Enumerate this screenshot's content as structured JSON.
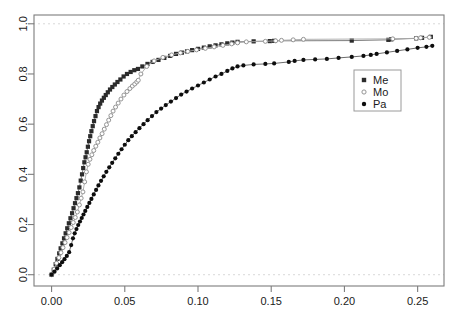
{
  "figure": {
    "background_color": "#ffffff",
    "width": 456,
    "height": 322
  },
  "chart_data": {
    "type": "line",
    "title": "",
    "subtitle": "",
    "xlabel": "",
    "ylabel": "",
    "xlim": [
      -0.012,
      0.268
    ],
    "ylim": [
      -0.045,
      1.035
    ],
    "grid": false,
    "reference_lines": [
      {
        "axis": "y",
        "value": 1.0,
        "style": "dashed",
        "color": "#d8d8d8"
      },
      {
        "axis": "y",
        "value": 0.0,
        "style": "dashed",
        "color": "#d8d8d8"
      }
    ],
    "xticks": [
      0.0,
      0.05,
      0.1,
      0.15,
      0.2,
      0.25
    ],
    "xticklabels": [
      "0.00",
      "0.05",
      "0.10",
      "0.15",
      "0.20",
      "0.25"
    ],
    "yticks": [
      0.0,
      0.2,
      0.4,
      0.6,
      0.8,
      1.0
    ],
    "yticklabels": [
      "0.0",
      "0.2",
      "0.4",
      "0.6",
      "0.8",
      "1.0"
    ],
    "legend": {
      "position": "right",
      "entries": [
        {
          "name": "Me",
          "marker": "filled-square",
          "color": "#2b2b2b"
        },
        {
          "name": "Mo",
          "marker": "open-circle",
          "color": "#8e8e8e"
        },
        {
          "name": "Pa",
          "marker": "filled-circle",
          "color": "#0d0d0d"
        }
      ]
    },
    "series": [
      {
        "name": "Me",
        "marker": "filled-square",
        "color": "#2b2b2b",
        "line_color": "#6f6f6f",
        "x": [
          0.0,
          0.0015,
          0.0028,
          0.004,
          0.0052,
          0.0062,
          0.0074,
          0.0085,
          0.0096,
          0.0107,
          0.0118,
          0.0129,
          0.014,
          0.015,
          0.016,
          0.017,
          0.018,
          0.019,
          0.0199,
          0.0208,
          0.0216,
          0.0224,
          0.0232,
          0.024,
          0.0248,
          0.0256,
          0.0264,
          0.0272,
          0.0281,
          0.029,
          0.03,
          0.031,
          0.0321,
          0.0332,
          0.0344,
          0.0357,
          0.037,
          0.0384,
          0.0399,
          0.0415,
          0.0432,
          0.045,
          0.047,
          0.0492,
          0.0515,
          0.054,
          0.0565,
          0.059,
          0.062,
          0.0655,
          0.069,
          0.073,
          0.077,
          0.081,
          0.085,
          0.089,
          0.0925,
          0.096,
          0.1,
          0.104,
          0.108,
          0.112,
          0.116,
          0.12,
          0.1235,
          0.127,
          0.138,
          0.149,
          0.152,
          0.205,
          0.23,
          0.232,
          0.249,
          0.253,
          0.259
        ],
        "y": [
          0.0,
          0.02,
          0.042,
          0.063,
          0.085,
          0.105,
          0.125,
          0.145,
          0.165,
          0.185,
          0.205,
          0.225,
          0.245,
          0.265,
          0.285,
          0.305,
          0.325,
          0.348,
          0.375,
          0.4,
          0.425,
          0.448,
          0.468,
          0.488,
          0.51,
          0.532,
          0.552,
          0.572,
          0.592,
          0.612,
          0.632,
          0.652,
          0.668,
          0.682,
          0.694,
          0.705,
          0.716,
          0.727,
          0.738,
          0.748,
          0.758,
          0.768,
          0.778,
          0.79,
          0.8,
          0.808,
          0.815,
          0.82,
          0.83,
          0.84,
          0.848,
          0.856,
          0.864,
          0.872,
          0.88,
          0.885,
          0.89,
          0.895,
          0.9,
          0.905,
          0.91,
          0.914,
          0.918,
          0.922,
          0.925,
          0.928,
          0.93,
          0.931,
          0.932,
          0.933,
          0.936,
          0.938,
          0.942,
          0.944,
          0.948
        ]
      },
      {
        "name": "Mo",
        "marker": "open-circle",
        "color": "#8e8e8e",
        "line_color": "#a8a8a8",
        "x": [
          0.0,
          0.0018,
          0.0034,
          0.005,
          0.0064,
          0.0078,
          0.0092,
          0.0106,
          0.012,
          0.0134,
          0.0148,
          0.0162,
          0.0176,
          0.019,
          0.0202,
          0.0214,
          0.0226,
          0.0238,
          0.025,
          0.0262,
          0.0275,
          0.0288,
          0.0302,
          0.0316,
          0.033,
          0.0345,
          0.036,
          0.0375,
          0.039,
          0.0405,
          0.042,
          0.0437,
          0.0455,
          0.0474,
          0.0494,
          0.0515,
          0.0535,
          0.0552,
          0.0568,
          0.0582,
          0.0592,
          0.061,
          0.065,
          0.07,
          0.076,
          0.082,
          0.088,
          0.093,
          0.099,
          0.105,
          0.111,
          0.117,
          0.123,
          0.127,
          0.133,
          0.146,
          0.153,
          0.157,
          0.165,
          0.172,
          0.233,
          0.249,
          0.252,
          0.258
        ],
        "y": [
          0.0,
          0.022,
          0.046,
          0.068,
          0.088,
          0.108,
          0.128,
          0.148,
          0.168,
          0.188,
          0.208,
          0.228,
          0.25,
          0.278,
          0.305,
          0.33,
          0.37,
          0.41,
          0.44,
          0.46,
          0.478,
          0.495,
          0.512,
          0.528,
          0.545,
          0.562,
          0.58,
          0.598,
          0.616,
          0.634,
          0.652,
          0.668,
          0.684,
          0.7,
          0.716,
          0.73,
          0.742,
          0.752,
          0.76,
          0.768,
          0.775,
          0.8,
          0.83,
          0.852,
          0.866,
          0.876,
          0.884,
          0.89,
          0.896,
          0.902,
          0.908,
          0.914,
          0.92,
          0.924,
          0.928,
          0.93,
          0.932,
          0.934,
          0.936,
          0.938,
          0.94,
          0.942,
          0.944,
          0.946
        ]
      },
      {
        "name": "Pa",
        "marker": "filled-circle",
        "color": "#0d0d0d",
        "line_color": "#5a5a5a",
        "x": [
          0.0,
          0.002,
          0.0038,
          0.0056,
          0.0072,
          0.0088,
          0.0104,
          0.012,
          0.0134,
          0.0146,
          0.0158,
          0.017,
          0.0182,
          0.0194,
          0.0206,
          0.0218,
          0.023,
          0.0244,
          0.0258,
          0.0272,
          0.0288,
          0.0304,
          0.032,
          0.0338,
          0.0356,
          0.0374,
          0.0394,
          0.0414,
          0.0435,
          0.0456,
          0.0478,
          0.05,
          0.0524,
          0.0548,
          0.0574,
          0.06,
          0.0628,
          0.0656,
          0.0686,
          0.0716,
          0.0748,
          0.078,
          0.0815,
          0.085,
          0.0885,
          0.0922,
          0.096,
          0.1,
          0.104,
          0.108,
          0.112,
          0.116,
          0.12,
          0.1235,
          0.127,
          0.131,
          0.138,
          0.146,
          0.152,
          0.162,
          0.166,
          0.172,
          0.18,
          0.188,
          0.196,
          0.205,
          0.213,
          0.218,
          0.222,
          0.229,
          0.236,
          0.243,
          0.25,
          0.256,
          0.26
        ],
        "y": [
          0.0,
          0.012,
          0.025,
          0.038,
          0.05,
          0.062,
          0.075,
          0.09,
          0.118,
          0.145,
          0.165,
          0.182,
          0.198,
          0.212,
          0.226,
          0.24,
          0.254,
          0.27,
          0.286,
          0.302,
          0.32,
          0.338,
          0.356,
          0.374,
          0.392,
          0.41,
          0.428,
          0.446,
          0.464,
          0.482,
          0.5,
          0.518,
          0.536,
          0.552,
          0.568,
          0.584,
          0.6,
          0.616,
          0.632,
          0.648,
          0.662,
          0.676,
          0.69,
          0.704,
          0.718,
          0.73,
          0.742,
          0.754,
          0.766,
          0.778,
          0.79,
          0.8,
          0.812,
          0.822,
          0.83,
          0.834,
          0.838,
          0.84,
          0.842,
          0.848,
          0.852,
          0.856,
          0.858,
          0.86,
          0.864,
          0.868,
          0.872,
          0.876,
          0.88,
          0.886,
          0.892,
          0.898,
          0.904,
          0.908,
          0.912
        ]
      }
    ]
  }
}
